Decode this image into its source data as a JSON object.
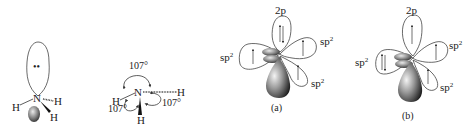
{
  "figure": {
    "panel_ammonia_lone_pair": {
      "center_atom": "N",
      "hydrogens": [
        "H",
        "H",
        "H"
      ],
      "lone_pair": "••"
    },
    "panel_ammonia_angles": {
      "center_atom": "N",
      "hydrogens": [
        "H",
        "H",
        "H"
      ],
      "angles": [
        "107°",
        "107°",
        "107°"
      ]
    },
    "panel_a": {
      "caption": "(a)",
      "orbital_top": "2p",
      "orbital_left": "sp",
      "orbital_right": "sp",
      "orbital_lower_right": "sp",
      "superscript": "2",
      "top_electrons": "paired",
      "left_electrons": "single",
      "right_electrons": "single",
      "lower_right_electrons": "single"
    },
    "panel_b": {
      "caption": "(b)",
      "orbital_top": "2p",
      "orbital_left": "sp",
      "orbital_right": "sp",
      "orbital_lower_right": "sp",
      "superscript": "2",
      "top_electrons": "single",
      "left_electrons": "paired",
      "right_electrons": "single",
      "lower_right_electrons": "single"
    },
    "colors": {
      "line": "#333333",
      "lobe_dark": "#2a2a2a",
      "lobe_light": "#cfcfcf"
    }
  }
}
